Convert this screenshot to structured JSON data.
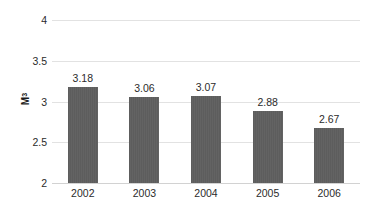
{
  "chart_data": {
    "type": "bar",
    "title": "",
    "subtitle": "",
    "xlabel": "",
    "ylabel": "M³",
    "ylabel_base": "M",
    "ylabel_superscript": "3",
    "categories": [
      "2002",
      "2003",
      "2004",
      "2005",
      "2006"
    ],
    "values": [
      3.18,
      3.06,
      3.07,
      2.88,
      2.67
    ],
    "value_labels": [
      "3.18",
      "3.06",
      "3.07",
      "2.88",
      "2.67"
    ],
    "ylim": [
      2,
      4
    ],
    "y_ticks": [
      2,
      2.5,
      3,
      3.5,
      4
    ],
    "y_tick_labels": [
      "2",
      "2.5",
      "3",
      "3.5",
      "4"
    ],
    "grid": true,
    "grid_axis": "y",
    "legend": false,
    "legend_position": "none",
    "show_data_labels": true,
    "series": [
      {
        "name": "",
        "values": [
          3.18,
          3.06,
          3.07,
          2.88,
          2.67
        ]
      }
    ]
  },
  "style": {
    "background_color": "#ffffff",
    "bar_color": "#5f5f5f",
    "gridline_color": "#e2e2e2",
    "baseline_color": "#d2d2d2",
    "text_color": "#2b2b2b",
    "axis_title_color": "#1a1a1a"
  }
}
